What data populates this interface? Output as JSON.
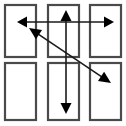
{
  "figure": {
    "title": "",
    "canvas": {
      "width": 126,
      "height": 126,
      "background": "#ffffff"
    },
    "colors": {
      "rectangle_stroke": "#4a4a4a",
      "rectangle_fill": "#ffffff",
      "arrow_stroke": "#1a1a1a",
      "arrow_fill": "#000000"
    },
    "grid": {
      "rows": 2,
      "columns": 3,
      "rectangle_count": 6,
      "rectangle_stroke_width": 2.2
    }
  },
  "rectangles": [
    {
      "id": "rect-top-left",
      "row": 1,
      "col": 1,
      "x": 5,
      "y": 5,
      "width": 31,
      "height": 52
    },
    {
      "id": "rect-top-center",
      "row": 1,
      "col": 2,
      "x": 48,
      "y": 5,
      "width": 31,
      "height": 52
    },
    {
      "id": "rect-top-right",
      "row": 1,
      "col": 3,
      "x": 90,
      "y": 5,
      "width": 31,
      "height": 52
    },
    {
      "id": "rect-bottom-left",
      "row": 2,
      "col": 1,
      "x": 5,
      "y": 63,
      "width": 31,
      "height": 57
    },
    {
      "id": "rect-bottom-center",
      "row": 2,
      "col": 2,
      "x": 48,
      "y": 63,
      "width": 31,
      "height": 57
    },
    {
      "id": "rect-bottom-right",
      "row": 2,
      "col": 3,
      "x": 90,
      "y": 63,
      "width": 31,
      "height": 57
    }
  ],
  "arrows": [
    {
      "id": "arrow-horizontal",
      "orientation": "horizontal",
      "heads": "double",
      "from": {
        "x": 17,
        "y": 22
      },
      "to": {
        "x": 114,
        "y": 22
      },
      "stroke_width": 1.6,
      "head_length": 10,
      "head_width": 11
    },
    {
      "id": "arrow-vertical",
      "orientation": "vertical",
      "heads": "double",
      "from": {
        "x": 66,
        "y": 10
      },
      "to": {
        "x": 66,
        "y": 114
      },
      "stroke_width": 1.6,
      "head_length": 11,
      "head_width": 11
    },
    {
      "id": "arrow-diagonal",
      "orientation": "diagonal",
      "heads": "double",
      "from": {
        "x": 29,
        "y": 28
      },
      "to": {
        "x": 111,
        "y": 83
      },
      "stroke_width": 1.6,
      "head_length": 12,
      "head_width": 11
    }
  ]
}
